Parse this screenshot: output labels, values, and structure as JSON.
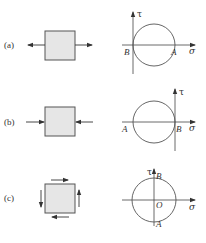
{
  "figure": {
    "colors": {
      "line": "#555555",
      "fill": "#e6e6e6",
      "text": "#333333"
    },
    "panels": [
      {
        "id": "a",
        "label": "(a)",
        "loading": "uniaxial tension",
        "mohr": {
          "point_A": "A",
          "point_B": "B",
          "sigma_axis": "σ",
          "tau_axis": "τ"
        }
      },
      {
        "id": "b",
        "label": "(b)",
        "loading": "uniaxial compression",
        "mohr": {
          "point_A": "A",
          "point_B": "B",
          "sigma_axis": "σ",
          "tau_axis": "τ"
        }
      },
      {
        "id": "c",
        "label": "(c)",
        "loading": "pure shear",
        "mohr": {
          "point_A": "A",
          "point_B": "B",
          "origin": "O",
          "sigma_axis": "σ",
          "tau_axis": "τ"
        }
      }
    ]
  }
}
